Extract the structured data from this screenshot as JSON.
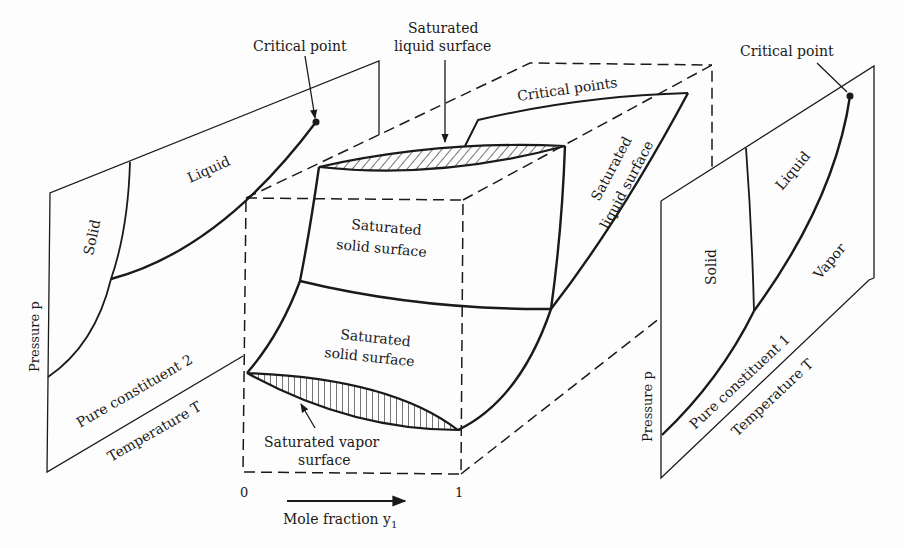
{
  "figure": {
    "colors": {
      "ink": "#1a1a1a",
      "paper": "#fdfdfd"
    }
  },
  "left_panel": {
    "name": "Pure constituent 2",
    "critical_point_label": "Critical point",
    "solid_label": "Solid",
    "liquid_label": "Liquid",
    "pressure_axis_label": "Pressure p",
    "constituent_label": "Pure constituent 2",
    "temperature_axis_label": "Temperature T"
  },
  "center_block": {
    "saturated_liquid_top_label_line1": "Saturated",
    "saturated_liquid_top_label_line2": "liquid surface",
    "critical_points_label": "Critical points",
    "upper_solid_label_line1": "Saturated",
    "upper_solid_label_line2": "solid surface",
    "lower_solid_label_line1": "Saturated",
    "lower_solid_label_line2": "solid surface",
    "vapor_label_line1": "Saturated vapor",
    "vapor_label_line2": "surface",
    "side_liquid_label_line1": "Saturated",
    "side_liquid_label_line2": "liquid surface",
    "x_axis": {
      "tick_start": "0",
      "tick_end": "1",
      "label": "Mole fraction y",
      "label_subscript": "1"
    }
  },
  "right_panel": {
    "name": "Pure constituent 1",
    "critical_point_label": "Critical point",
    "solid_label": "Solid",
    "liquid_label": "Liquid",
    "vapor_label": "Vapor",
    "pressure_axis_label": "Pressure p",
    "constituent_label": "Pure constituent 1",
    "temperature_axis_label": "Temperature T"
  }
}
